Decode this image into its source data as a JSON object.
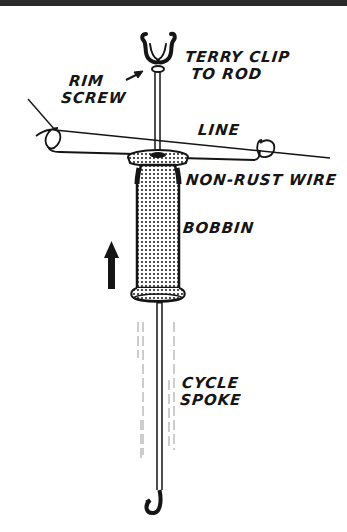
{
  "figure": {
    "labels": {
      "terry_clip": [
        "TERRY CLIP",
        "TO ROD"
      ],
      "rim_screw": [
        "RIM",
        "SCREW"
      ],
      "line": "LINE",
      "non_rust_wire": "NON-RUST WIRE",
      "bobbin": "BOBBIN",
      "cycle_spoke": [
        "CYCLE",
        "SPOKE"
      ]
    },
    "colors": {
      "ink": "#151515",
      "background": "#ffffff",
      "top_band": "#2a2a2a"
    },
    "direction_arrow": "up"
  }
}
